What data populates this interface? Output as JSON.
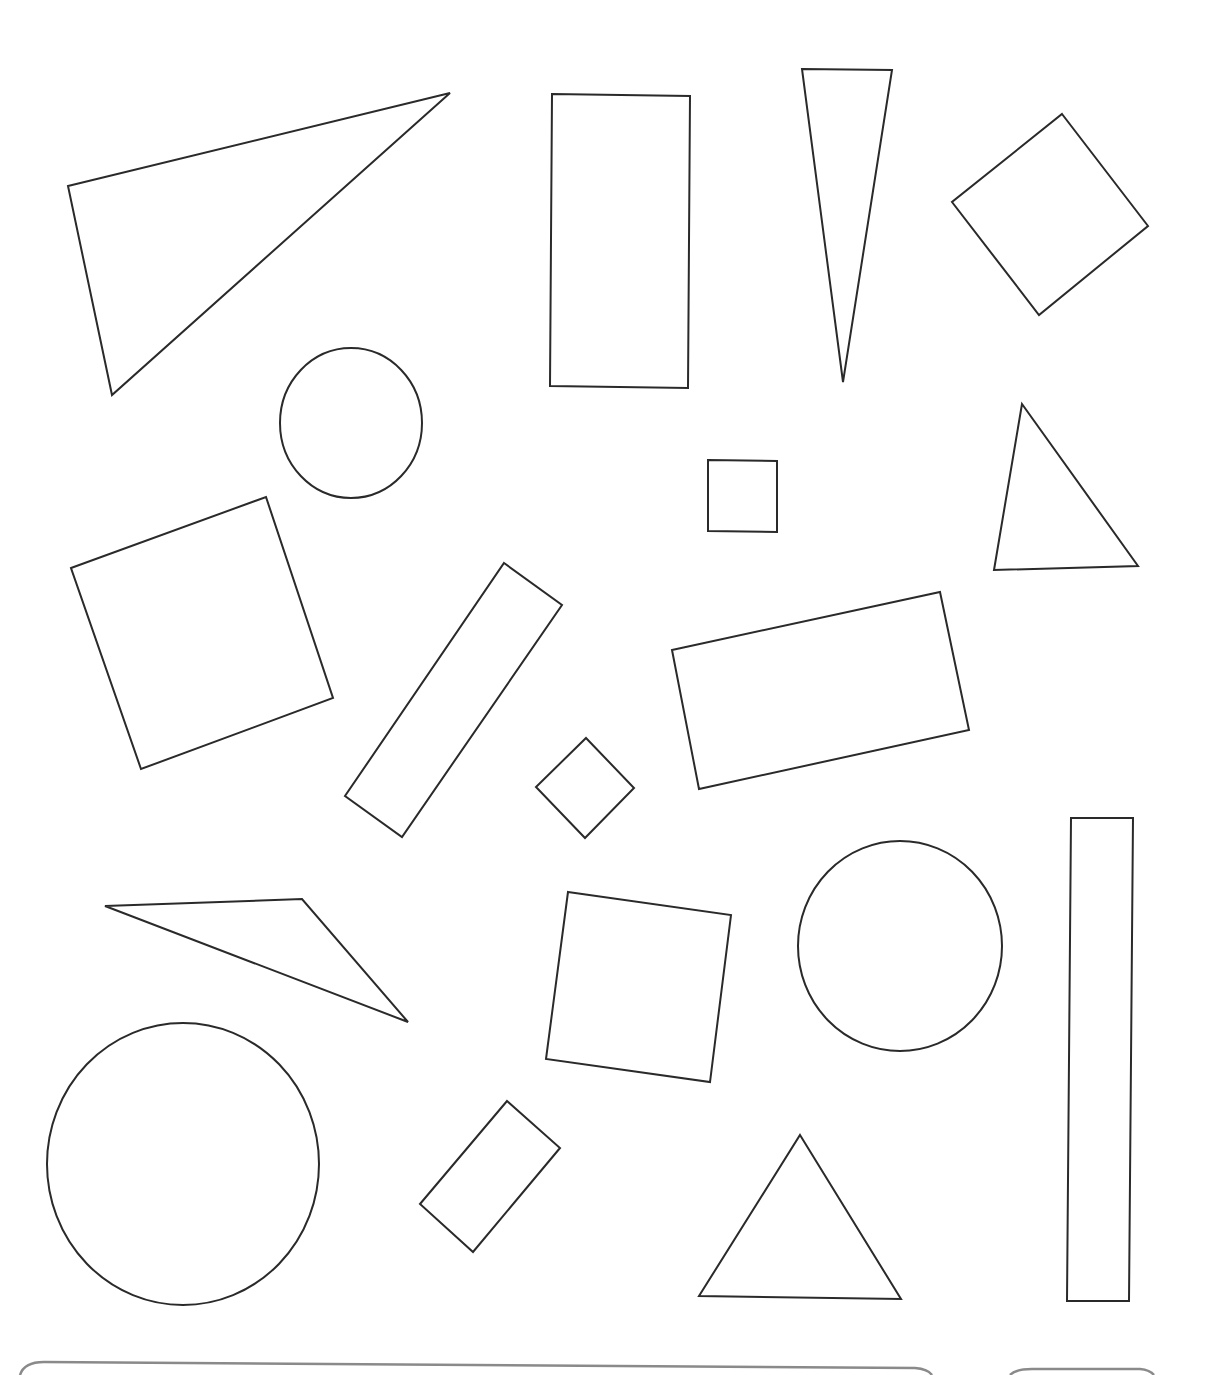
{
  "worksheet": {
    "stroke_color": "#2a2a2a",
    "stroke_width": 2,
    "box_stroke_color": "#8a8a8a",
    "shapes": [
      {
        "name": "triangle-large-top-left",
        "type": "polygon",
        "points": "68,186 450,93 112,395"
      },
      {
        "name": "rectangle-tall-top-center",
        "type": "polygon",
        "points": "552,94 690,96 688,388 550,386"
      },
      {
        "name": "triangle-thin-top",
        "type": "polygon",
        "points": "802,69 892,70 843,382"
      },
      {
        "name": "square-rotated-top-right",
        "type": "polygon",
        "points": "1062,114 1148,226 1039,315 952,202"
      },
      {
        "name": "circle-small-upper",
        "type": "ellipse",
        "cx": 351,
        "cy": 423,
        "rx": 71,
        "ry": 75
      },
      {
        "name": "square-small-center",
        "type": "polygon",
        "points": "708,460 777,461 777,532 708,531"
      },
      {
        "name": "triangle-right-middle",
        "type": "polygon",
        "points": "1022,404 1138,566 994,570"
      },
      {
        "name": "square-rotated-left",
        "type": "polygon",
        "points": "71,568 266,497 333,698 141,769"
      },
      {
        "name": "bar-diagonal-center",
        "type": "polygon",
        "points": "504,563 562,605 402,837 345,796"
      },
      {
        "name": "diamond-small-center",
        "type": "polygon",
        "points": "586,738 634,788 585,838 536,787"
      },
      {
        "name": "rectangle-tilted-right",
        "type": "polygon",
        "points": "672,650 940,592 969,730 699,789"
      },
      {
        "name": "triangle-flat-left",
        "type": "polygon",
        "points": "105,906 302,899 408,1022"
      },
      {
        "name": "square-tilted-center",
        "type": "polygon",
        "points": "568,892 731,915 710,1082 546,1059"
      },
      {
        "name": "circle-medium-right",
        "type": "ellipse",
        "cx": 900,
        "cy": 946,
        "rx": 102,
        "ry": 105
      },
      {
        "name": "rectangle-tall-right",
        "type": "polygon",
        "points": "1071,818 1133,818 1129,1301 1067,1301"
      },
      {
        "name": "circle-large-bottom-left",
        "type": "ellipse",
        "cx": 183,
        "cy": 1164,
        "rx": 136,
        "ry": 141
      },
      {
        "name": "rectangle-small-rotated-bottom",
        "type": "polygon",
        "points": "507,1101 560,1148 473,1252 420,1204"
      },
      {
        "name": "triangle-bottom-center",
        "type": "polygon",
        "points": "800,1135 901,1299 699,1296"
      }
    ],
    "answer_boxes": [
      {
        "name": "answer-box-wide",
        "path": "M 20 1375 Q 24 1362 44 1362 L 915 1368 Q 928 1369 932 1375"
      },
      {
        "name": "answer-box-small",
        "path": "M 1010 1375 Q 1016 1369 1032 1369 L 1140 1369 Q 1150 1370 1154 1375"
      }
    ]
  }
}
